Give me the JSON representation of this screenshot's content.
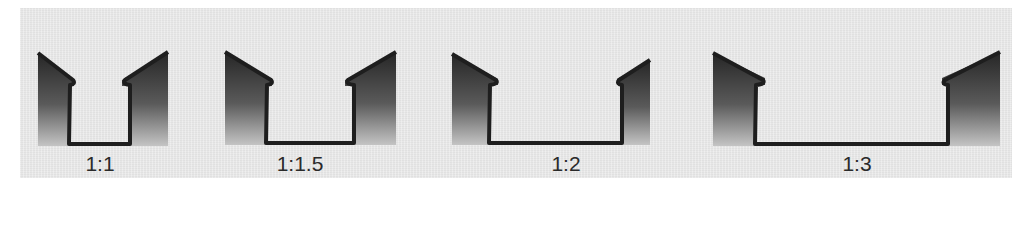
{
  "figure": {
    "colors": {
      "background": "#e9e9e9",
      "bank_top": "#2b2b2b",
      "bank_bottom": "#bdbdbd",
      "outline": "#1e1e1e"
    },
    "panels": [
      {
        "label": "1:1",
        "ratio_depth": 1,
        "ratio_width": 1
      },
      {
        "label": "1:1.5",
        "ratio_depth": 1,
        "ratio_width": 1.5
      },
      {
        "label": "1:2",
        "ratio_depth": 1,
        "ratio_width": 2
      },
      {
        "label": "1:3",
        "ratio_depth": 1,
        "ratio_width": 3
      }
    ]
  }
}
